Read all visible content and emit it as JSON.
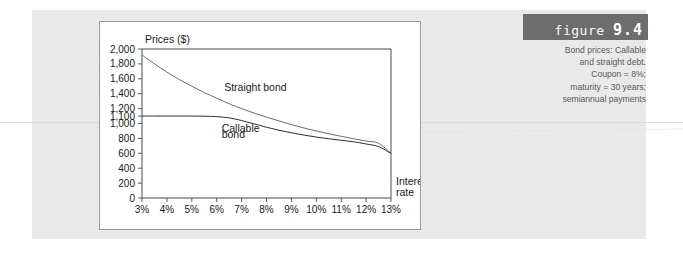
{
  "figure": {
    "label": "figure",
    "number": "9.4",
    "caption_lines": [
      "Bond prices: Callable",
      "and straight debt.",
      "Coupon = 8%;",
      "maturity = 30 years;",
      "semiannual payments"
    ],
    "header_bg": "#6d6d6d",
    "caption_color": "#595959"
  },
  "chart_data": {
    "type": "line",
    "title": "",
    "ylabel": "Prices ($)",
    "xlabel": "Interest rate",
    "xlabel_lines": [
      "Interest",
      "rate"
    ],
    "grid": false,
    "legend": "inline-annotations",
    "xlim": [
      3,
      13
    ],
    "ylim": [
      0,
      2000
    ],
    "x_tick_labels": [
      "3%",
      "4%",
      "5%",
      "6%",
      "7%",
      "8%",
      "9%",
      "10%",
      "11%",
      "12%",
      "13%"
    ],
    "x_tick_values": [
      3,
      4,
      5,
      6,
      7,
      8,
      9,
      10,
      11,
      12,
      13
    ],
    "y_tick_labels": [
      "0",
      "200",
      "400",
      "600",
      "800",
      "1,000",
      "1,100",
      "1,200",
      "1,400",
      "1,600",
      "1,800",
      "2,000"
    ],
    "y_tick_values": [
      0,
      200,
      400,
      600,
      800,
      1000,
      1100,
      1200,
      1400,
      1600,
      1800,
      2000
    ],
    "x": [
      3,
      3.5,
      4,
      4.5,
      5,
      5.5,
      6,
      6.5,
      7,
      7.5,
      8,
      8.5,
      9,
      9.5,
      10,
      10.5,
      11,
      11.5,
      12,
      12.5,
      13
    ],
    "series": [
      {
        "name": "Straight bond",
        "color": "#6b6b6b",
        "values": [
          1920,
          1800,
          1690,
          1590,
          1500,
          1415,
          1340,
          1265,
          1200,
          1140,
          1085,
          1035,
          985,
          940,
          900,
          862,
          828,
          795,
          765,
          735,
          600
        ]
      },
      {
        "name": "Callable bond",
        "color": "#2e2e2e",
        "values": [
          1100,
          1100,
          1100,
          1100,
          1100,
          1098,
          1092,
          1075,
          1040,
          995,
          950,
          910,
          875,
          845,
          818,
          795,
          775,
          755,
          725,
          690,
          598
        ]
      }
    ],
    "annotations": [
      {
        "text": "Straight bond",
        "x": 6.3,
        "y": 1430
      },
      {
        "text": "Callable",
        "x": 6.2,
        "y": 880
      },
      {
        "text": "bond",
        "x": 6.2,
        "y": 800
      }
    ]
  }
}
